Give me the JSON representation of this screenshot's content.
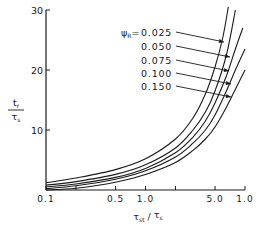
{
  "chart_data": {
    "type": "line",
    "title": "",
    "xlabel": "τst / τs",
    "ylabel_num": "tr",
    "ylabel_den": "τs",
    "x_scale": "log",
    "xlim": [
      0.1,
      10
    ],
    "ylim": [
      0,
      30
    ],
    "x_ticks": [
      {
        "value": 0.1,
        "label": "0.1"
      },
      {
        "value": 0.5,
        "label": "0.5"
      },
      {
        "value": 1.0,
        "label": "1.0"
      },
      {
        "value": 5.0,
        "label": "5.0"
      },
      {
        "value": 10.0,
        "label": "1.0"
      }
    ],
    "x_minor_ticks": [
      0.2,
      2.0
    ],
    "y_ticks": [
      {
        "value": 10,
        "label": "10"
      },
      {
        "value": 20,
        "label": "20"
      },
      {
        "value": 30,
        "label": "30"
      }
    ],
    "grid": false,
    "legend_prefix": "ψR =",
    "series": [
      {
        "name": "0.025",
        "x": [
          0.1,
          0.2,
          0.5,
          1.0,
          2.0,
          3.0,
          4.0,
          5.0,
          6.0,
          6.8
        ],
        "y": [
          1.2,
          2.0,
          3.4,
          5.2,
          8.5,
          12.0,
          16.0,
          20.5,
          25.5,
          30.5
        ]
      },
      {
        "name": "0.050",
        "x": [
          0.1,
          0.2,
          0.5,
          1.0,
          2.0,
          3.0,
          4.0,
          5.0,
          6.5,
          8.0
        ],
        "y": [
          0.8,
          1.4,
          2.6,
          4.2,
          7.0,
          10.0,
          13.0,
          16.5,
          22.5,
          30.0
        ]
      },
      {
        "name": "0.075",
        "x": [
          0.1,
          0.2,
          0.5,
          1.0,
          2.0,
          3.0,
          4.0,
          5.0,
          6.5,
          8.0,
          9.5
        ],
        "y": [
          0.5,
          1.0,
          2.1,
          3.6,
          6.2,
          8.8,
          11.5,
          14.5,
          19.0,
          23.5,
          27.0
        ]
      },
      {
        "name": "0.100",
        "x": [
          0.1,
          0.2,
          0.5,
          1.0,
          2.0,
          3.0,
          4.0,
          5.0,
          6.5,
          8.0,
          10.0
        ],
        "y": [
          0.2,
          0.7,
          1.8,
          3.2,
          5.5,
          7.8,
          10.0,
          12.5,
          16.5,
          20.0,
          23.5
        ]
      },
      {
        "name": "0.150",
        "x": [
          0.1,
          0.2,
          0.5,
          1.0,
          2.0,
          3.0,
          4.0,
          5.0,
          6.5,
          8.0,
          10.0
        ],
        "y": [
          0.0,
          0.3,
          1.3,
          2.6,
          4.6,
          6.6,
          8.5,
          10.5,
          13.8,
          16.8,
          20.0
        ]
      }
    ]
  }
}
